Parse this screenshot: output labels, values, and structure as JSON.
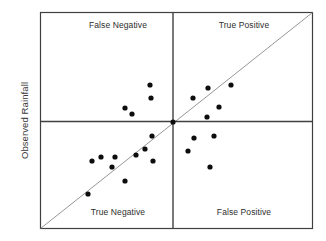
{
  "figure": {
    "background_color": "#ffffff",
    "axis_color": "#404040",
    "frame_color": "#404040",
    "diagonal_color": "#8a8a8a",
    "point_color": "#0d0d0d"
  },
  "axes": {
    "y_label": "Observed Rainfall",
    "x_label": ""
  },
  "quadrants": {
    "top_left": "False Negative",
    "top_right": "True Positive",
    "bottom_left": "True Negative",
    "bottom_right": "False Positive"
  },
  "chart_data": {
    "type": "scatter",
    "title": "",
    "xlabel": "",
    "ylabel": "Observed Rainfall",
    "xlim": [
      0,
      100
    ],
    "ylim": [
      0,
      100
    ],
    "grid": false,
    "legend": "none",
    "annotations": [
      {
        "text": "False Negative",
        "quadrant": "top-left"
      },
      {
        "text": "True Positive",
        "quadrant": "top-right"
      },
      {
        "text": "True Negative",
        "quadrant": "bottom-left"
      },
      {
        "text": "False Positive",
        "quadrant": "bottom-right"
      }
    ],
    "reference_lines": [
      {
        "name": "one-to-one-diagonal",
        "from": [
          0,
          0
        ],
        "to": [
          100,
          100
        ],
        "color": "#8a8a8a"
      },
      {
        "name": "vertical-threshold",
        "x": 48.7,
        "color": "#404040"
      },
      {
        "name": "horizontal-threshold",
        "y": 49.5,
        "color": "#404040"
      }
    ],
    "point_radius_px": 2.6,
    "points_px": [
      [
        150,
        85
      ],
      [
        151,
        98
      ],
      [
        125,
        108
      ],
      [
        132,
        114
      ],
      [
        173,
        122
      ],
      [
        208,
        88
      ],
      [
        231,
        85
      ],
      [
        193,
        98
      ],
      [
        219,
        107
      ],
      [
        207,
        117
      ],
      [
        152,
        136
      ],
      [
        145,
        149
      ],
      [
        136,
        155
      ],
      [
        115,
        157
      ],
      [
        101,
        157
      ],
      [
        92,
        161
      ],
      [
        112,
        167
      ],
      [
        153,
        161
      ],
      [
        125,
        181
      ],
      [
        88,
        194
      ],
      [
        194,
        138
      ],
      [
        214,
        136
      ],
      [
        188,
        151
      ],
      [
        210,
        167
      ]
    ],
    "series": [
      {
        "name": "Observed vs Forecast Rainfall",
        "x": [
          45.2,
          45.6,
          31.1,
          33.7,
          48.7,
          61.5,
          69.9,
          56.0,
          65.6,
          61.1,
          41.0,
          38.5,
          35.2,
          27.5,
          22.4,
          19.0,
          26.4,
          41.4,
          31.1,
          17.6,
          56.4,
          63.7,
          54.2,
          62.3
        ],
        "y": [
          66.2,
          60.2,
          55.6,
          52.8,
          49.1,
          64.8,
          66.2,
          61.1,
          56.0,
          51.4,
          42.6,
          36.6,
          33.8,
          32.9,
          32.9,
          31.0,
          28.2,
          31.0,
          21.8,
          15.7,
          41.7,
          42.6,
          35.6,
          28.2
        ]
      }
    ]
  }
}
